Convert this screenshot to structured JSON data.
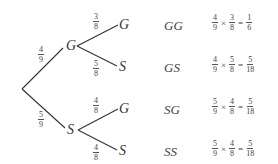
{
  "tree": {
    "first_level": [
      {
        "label": "G",
        "prob_num": "4",
        "prob_den": "9"
      },
      {
        "label": "S",
        "prob_num": "5",
        "prob_den": "9"
      }
    ],
    "second_level": [
      {
        "parent": "G",
        "label": "G",
        "prob_num": "3",
        "prob_den": "8"
      },
      {
        "parent": "G",
        "label": "S",
        "prob_num": "5",
        "prob_den": "8"
      },
      {
        "parent": "S",
        "label": "G",
        "prob_num": "4",
        "prob_den": "8"
      },
      {
        "parent": "S",
        "label": "S",
        "prob_num": "4",
        "prob_den": "8"
      }
    ]
  },
  "outcomes": [
    {
      "label": "GG",
      "a_num": "4",
      "a_den": "9",
      "b_num": "3",
      "b_den": "8",
      "times": "×",
      "equals": "=",
      "r_num": "1",
      "r_den": "6"
    },
    {
      "label": "GS",
      "a_num": "4",
      "a_den": "9",
      "b_num": "5",
      "b_den": "8",
      "times": "×",
      "equals": "=",
      "r_num": "5",
      "r_den": "18"
    },
    {
      "label": "SG",
      "a_num": "5",
      "a_den": "9",
      "b_num": "4",
      "b_den": "8",
      "times": "×",
      "equals": "=",
      "r_num": "5",
      "r_den": "18"
    },
    {
      "label": "SS",
      "a_num": "5",
      "a_den": "9",
      "b_num": "4",
      "b_den": "8",
      "times": "×",
      "equals": "=",
      "r_num": "5",
      "r_den": "18"
    }
  ]
}
